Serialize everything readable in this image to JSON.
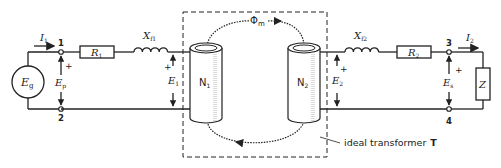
{
  "diagram": {
    "type": "transformer equivalent circuit",
    "primary": {
      "source": {
        "label": "E",
        "sub": "g"
      },
      "current": {
        "label": "I",
        "sub": "1"
      },
      "terminal_top": "1",
      "terminal_bottom": "2",
      "terminal_voltage": {
        "label": "E",
        "sub": "p",
        "sign": "+"
      },
      "resistance": {
        "label": "R",
        "sub": "1"
      },
      "leakage_reactance": {
        "label": "X",
        "sub": "f1"
      },
      "emf": {
        "label": "E",
        "sub": "1",
        "sign": "+"
      },
      "winding": {
        "label": "N",
        "sub": "1"
      }
    },
    "core": {
      "flux": {
        "label": "Φ",
        "sub": "m"
      },
      "box_caption": "ideal transformer",
      "box_caption_id": "T"
    },
    "secondary": {
      "winding": {
        "label": "N",
        "sub": "2"
      },
      "emf": {
        "label": "E",
        "sub": "2",
        "sign": "+"
      },
      "leakage_reactance": {
        "label": "X",
        "sub": "f2"
      },
      "resistance": {
        "label": "R",
        "sub": "2"
      },
      "terminal_top": "3",
      "terminal_bottom": "4",
      "current": {
        "label": "I",
        "sub": "2"
      },
      "terminal_voltage": {
        "label": "E",
        "sub": "s",
        "sign": "+"
      },
      "load": {
        "label": "Z"
      }
    }
  },
  "colors": {
    "ink": "#222222",
    "background": "#ffffff"
  }
}
